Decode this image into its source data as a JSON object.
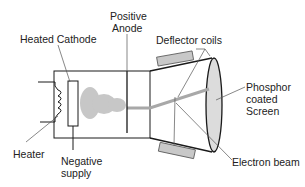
{
  "labels": {
    "heated_cathode": "Heated Cathode",
    "positive_anode_line1": "Positive",
    "positive_anode_line2": "Anode",
    "deflector_coils": "Deflector coils",
    "phosphor_line1": "Phosphor",
    "phosphor_line2": "coated",
    "phosphor_line3": "Screen",
    "heater": "Heater",
    "negative_supply_line1": "Negative",
    "negative_supply_line2": "supply",
    "electron_beam": "Electron beam"
  },
  "colors": {
    "stroke": "#1a1a1a",
    "leader": "#555555",
    "coil_fill": "#c8c8c8",
    "beam": "#a8a8a8",
    "screen_fill": "#dcdcdc",
    "cloud": "#9a9a9a"
  }
}
